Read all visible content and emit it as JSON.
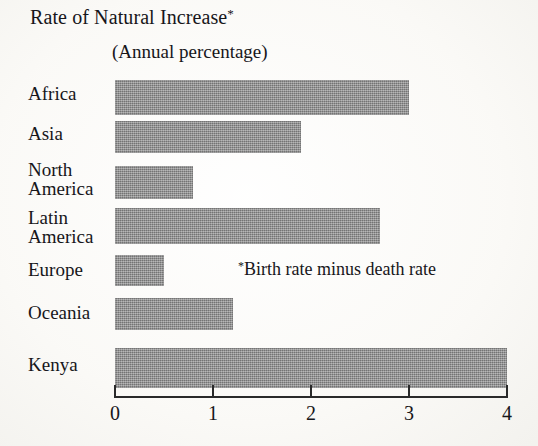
{
  "chart_data": {
    "type": "bar",
    "orientation": "horizontal",
    "title": "Rate of Natural Increase",
    "title_marker": "*",
    "subtitle": "(Annual percentage)",
    "footnote_marker": "*",
    "footnote": "Birth rate minus death rate",
    "xlabel": "",
    "ylabel": "",
    "xlim": [
      0,
      4
    ],
    "xticks": [
      0,
      1,
      2,
      3,
      4
    ],
    "xtick_labels": [
      "0",
      "1",
      "2",
      "3",
      "4"
    ],
    "grid": false,
    "legend": false,
    "bar_color": "#8c8c8c",
    "categories": [
      "Africa",
      "Asia",
      "North America",
      "Latin America",
      "Europe",
      "Oceania",
      "Kenya"
    ],
    "category_lines": [
      [
        "Africa"
      ],
      [
        "Asia"
      ],
      [
        "North",
        "America"
      ],
      [
        "Latin",
        "America"
      ],
      [
        "Europe"
      ],
      [
        "Oceania"
      ],
      [
        "Kenya"
      ]
    ],
    "values": [
      3.0,
      1.9,
      0.8,
      2.7,
      0.5,
      1.2,
      4.0
    ],
    "bars": [
      {
        "label": "Africa",
        "value": 3.0
      },
      {
        "label": "Asia",
        "value": 1.9
      },
      {
        "label": "North America",
        "value": 0.8
      },
      {
        "label": "Latin America",
        "value": 2.7
      },
      {
        "label": "Europe",
        "value": 0.5
      },
      {
        "label": "Oceania",
        "value": 1.2
      },
      {
        "label": "Kenya",
        "value": 4.0
      }
    ]
  },
  "labels": {
    "africa": "Africa",
    "asia": "Asia",
    "north": "North",
    "america1": "America",
    "latin": "Latin",
    "america2": "America",
    "europe": "Europe",
    "oceania": "Oceania",
    "kenya": "Kenya"
  },
  "ticks": {
    "t0": "0",
    "t1": "1",
    "t2": "2",
    "t3": "3",
    "t4": "4"
  }
}
